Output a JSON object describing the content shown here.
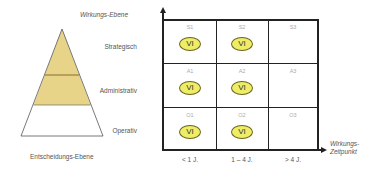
{
  "pyramid": {
    "title": "Wirkungs-Ebene",
    "footer": "Entscheidungs-Ebene",
    "levels": [
      {
        "label": "Strategisch",
        "fill": "#e8d488"
      },
      {
        "label": "Administrativ",
        "fill": "#e8d488"
      },
      {
        "label": "Operativ",
        "fill": "#ffffff"
      }
    ]
  },
  "matrix": {
    "x_axis_label_line1": "Wirkungs-",
    "x_axis_label_line2": "Zeitpunkt",
    "columns": [
      "< 1 J.",
      "1 – 4 J.",
      "> 4 J."
    ],
    "rows": [
      {
        "cells": [
          {
            "code": "S1",
            "marker": "VI"
          },
          {
            "code": "S2",
            "marker": "VI"
          },
          {
            "code": "S3",
            "marker": ""
          }
        ]
      },
      {
        "cells": [
          {
            "code": "A1",
            "marker": "VI"
          },
          {
            "code": "A2",
            "marker": "VI"
          },
          {
            "code": "A3",
            "marker": ""
          }
        ]
      },
      {
        "cells": [
          {
            "code": "O1",
            "marker": "VI"
          },
          {
            "code": "O2",
            "marker": "VI"
          },
          {
            "code": "O3",
            "marker": ""
          }
        ]
      }
    ],
    "marker_fill": "#eeee66",
    "marker_border": "#6b6420"
  }
}
